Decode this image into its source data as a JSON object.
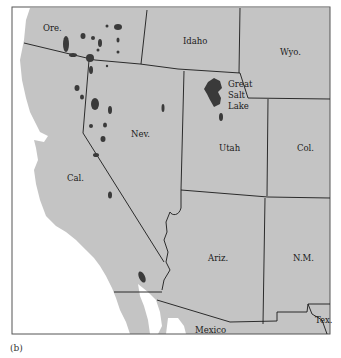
{
  "figure": {
    "caption": "(b)",
    "colors": {
      "land": "#c4c4c4",
      "ocean": "#ffffff",
      "lakes": "#3a3a3a",
      "borders": "#1a1a1a"
    }
  },
  "labels": {
    "oregon": "Ore.",
    "idaho": "Idaho",
    "wyoming": "Wyo.",
    "great_salt_lake_1": "Great",
    "great_salt_lake_2": "Salt",
    "great_salt_lake_3": "Lake",
    "nevada": "Nev.",
    "utah": "Utah",
    "colorado": "Col.",
    "california": "Cal.",
    "arizona": "Ariz.",
    "new_mexico": "N.M.",
    "mexico": "Mexico",
    "texas": "Tex."
  }
}
